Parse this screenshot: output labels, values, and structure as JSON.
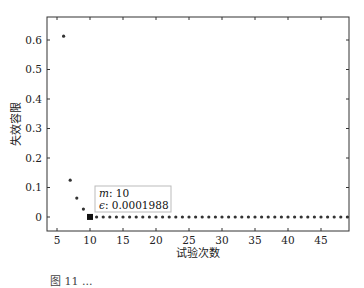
{
  "chart_data": {
    "type": "scatter",
    "title": "",
    "xlabel": "试验次数",
    "ylabel": "失效容限",
    "xlim": [
      3.5,
      49.2
    ],
    "ylim": [
      -0.047,
      0.61
    ],
    "xticks": [
      5,
      10,
      15,
      20,
      25,
      30,
      35,
      40,
      45
    ],
    "yticks": [
      0,
      0.1,
      0.2,
      0.3,
      0.4,
      0.5,
      0.6
    ],
    "ytick_labels": [
      "0",
      "0.1",
      "0.2",
      "0.3",
      "0.4",
      "0.5",
      "0.6"
    ],
    "grid": false,
    "series": [
      {
        "name": "失效容限",
        "x": [
          6,
          7,
          8,
          9,
          10,
          11,
          12,
          13,
          14,
          15,
          16,
          17,
          18,
          19,
          20,
          21,
          22,
          23,
          24,
          25,
          26,
          27,
          28,
          29,
          30,
          31,
          32,
          33,
          34,
          35,
          36,
          37,
          38,
          39,
          40,
          41,
          42,
          43,
          44,
          45,
          46,
          47,
          48,
          49
        ],
        "y": [
          0.613,
          0.125,
          0.064,
          0.027,
          0.0001988,
          0,
          0,
          0,
          0,
          0,
          0,
          0,
          0,
          0,
          0,
          0,
          0,
          0,
          0,
          0,
          0,
          0,
          0,
          0,
          0,
          0,
          0,
          0,
          0,
          0,
          0,
          0,
          0,
          0,
          0,
          0,
          0,
          0,
          0,
          0,
          0,
          0,
          0,
          0
        ]
      }
    ],
    "annotation": {
      "x": 10,
      "y": 0.0001988,
      "line1_label": "m",
      "line1_value": "10",
      "line2_label": "ϵ",
      "line2_value": "0.0001988"
    }
  },
  "caption": "图 11 ..."
}
